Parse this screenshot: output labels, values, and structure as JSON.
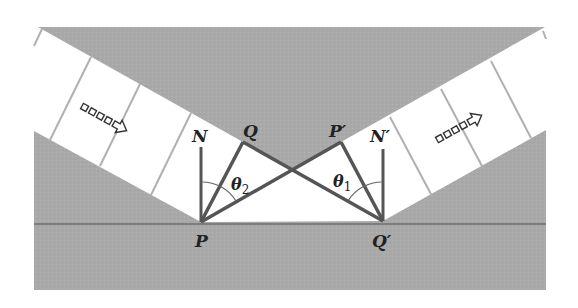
{
  "diagram": {
    "type": "geometric-optics",
    "colors": {
      "medium": "#a9a9a9",
      "surface_line": "#6f6f6f",
      "band": "#ffffff",
      "band_divider": "#b0b0b0",
      "stroke": "#555555",
      "arc": "#666666",
      "text": "#222222"
    },
    "labels": {
      "N": "N",
      "Q": "Q",
      "P_prime": "P′",
      "N_prime": "N′",
      "P": "P",
      "Q_prime": "Q′",
      "theta2_base": "θ",
      "theta2_sub": "2",
      "theta1_base": "θ",
      "theta1_sub": "1"
    },
    "arrows": {
      "incident": "incident-direction",
      "reflected": "reflected-direction"
    },
    "points": {
      "P": [
        201,
        222
      ],
      "Q": [
        243,
        142
      ],
      "N": [
        201,
        145
      ],
      "P_prime": [
        341,
        142
      ],
      "Q_prime": [
        383,
        221
      ],
      "N_prime": [
        383,
        147
      ]
    }
  }
}
